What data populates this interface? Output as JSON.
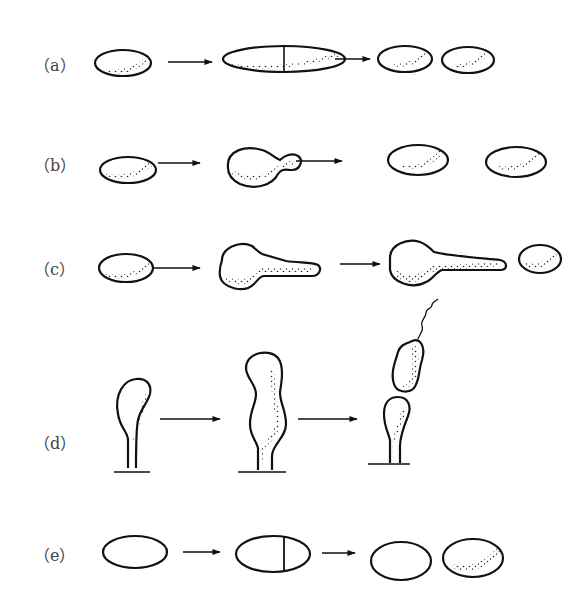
{
  "figure": {
    "rows": [
      {
        "id": "a",
        "label": "（a）",
        "stages": [
          "rod cell",
          "elongated cell with septum",
          "two daughter cells"
        ]
      },
      {
        "id": "b",
        "label": "（b）",
        "stages": [
          "oval cell",
          "budding cell",
          "two daughter cells"
        ]
      },
      {
        "id": "c",
        "label": "（c）",
        "stages": [
          "oval cell",
          "cell with growing filament",
          "filament with bud + daughter cell"
        ]
      },
      {
        "id": "d",
        "label": "（d）",
        "stages": [
          "stalked cell",
          "elongated stalked cell",
          "flagellated swarmer cell + stalked cell"
        ]
      },
      {
        "id": "e",
        "label": "（e）",
        "stages": [
          "hatched cell",
          "cell with hatched and dotted halves",
          "hatched daughter + plain daughter"
        ]
      }
    ],
    "arrow_glyph": "→",
    "colors": {
      "line": "#111111",
      "background": "#ffffff",
      "label": "#444444"
    }
  }
}
